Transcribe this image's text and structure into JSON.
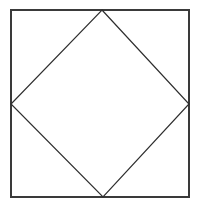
{
  "figure": {
    "kind": "geometry-diagram",
    "background_color": "#ffffff",
    "canvas": {
      "width": 203,
      "height": 210
    },
    "stroke_colors": {
      "outer_square": "#3a3a3a",
      "inner_square": "#2e2e2e"
    },
    "stroke_widths": {
      "outer_square": 2,
      "inner_square": 1.2
    },
    "outer_square": {
      "label": "outer square",
      "left": 11,
      "top": 10,
      "right": 189,
      "bottom": 197,
      "width": 178,
      "height": 187,
      "points": "11,10 189,10 189,197 11,197"
    },
    "inner_square": {
      "label": "inscribed rotated square (diamond)",
      "points": "102,10 189,104 103,197 11,104",
      "vertices": [
        {
          "name": "top-vertex",
          "x": 102,
          "y": 10
        },
        {
          "name": "right-vertex",
          "x": 189,
          "y": 104
        },
        {
          "name": "bottom-vertex",
          "x": 103,
          "y": 197
        },
        {
          "name": "left-vertex",
          "x": 11,
          "y": 104
        }
      ]
    },
    "labels": [],
    "text": []
  }
}
